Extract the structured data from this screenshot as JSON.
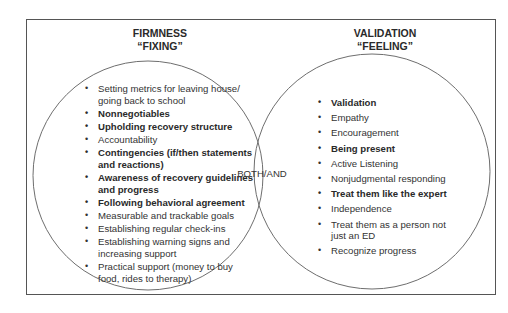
{
  "diagram": {
    "type": "venn",
    "left_set": {
      "title": "FIRMNESS",
      "subtitle": "“FIXING”",
      "items": [
        {
          "text": "Setting metrics for leaving house/ going back to school",
          "bold": false
        },
        {
          "text": "Nonnegotiables",
          "bold": true
        },
        {
          "text": "Upholding recovery structure",
          "bold": true
        },
        {
          "text": "Accountability",
          "bold": false
        },
        {
          "text": "Contingencies (if/then statements and reactions)",
          "bold": true
        },
        {
          "text": "Awareness of recovery guidelines and progress",
          "bold": true
        },
        {
          "text": "Following behavioral agreement",
          "bold": true
        },
        {
          "text": "Measurable and trackable goals",
          "bold": false
        },
        {
          "text": "Establishing regular check-ins",
          "bold": false
        },
        {
          "text": "Establishing warning signs and increasing support",
          "bold": false
        },
        {
          "text": "Practical support (money to buy food, rides to therapy)",
          "bold": false
        }
      ]
    },
    "right_set": {
      "title": "VALIDATION",
      "subtitle": "“FEELING”",
      "items": [
        {
          "text": "Validation",
          "bold": true
        },
        {
          "text": "Empathy",
          "bold": false
        },
        {
          "text": "Encouragement",
          "bold": false
        },
        {
          "text": "Being present",
          "bold": true
        },
        {
          "text": "Active Listening",
          "bold": false
        },
        {
          "text": "Nonjudgmental responding",
          "bold": false
        },
        {
          "text": "Treat them like the expert",
          "bold": true
        },
        {
          "text": "Independence",
          "bold": false
        },
        {
          "text": "Treat them as a person not just an ED",
          "bold": false
        },
        {
          "text": "Recognize progress",
          "bold": false
        }
      ]
    },
    "overlap_label": "BOTH/AND",
    "colors": {
      "outline": "#6e6e6e",
      "frame": "#555555",
      "text": "#2a2a2a"
    }
  }
}
